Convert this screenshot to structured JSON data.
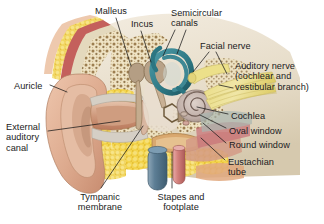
{
  "figure": {
    "background_color": "#ffffff",
    "width": 324,
    "height": 224,
    "label_color": "#1b1b22",
    "leader_color": "#1a1a1a"
  },
  "labels": [
    {
      "id": "malleus",
      "text": "Malleus",
      "x": 95,
      "y": 6,
      "align": "left"
    },
    {
      "id": "incus",
      "text": "Incus",
      "x": 131,
      "y": 19,
      "align": "left"
    },
    {
      "id": "semicircular_canals",
      "text": "Semicircular\ncanals",
      "x": 171,
      "y": 8,
      "align": "left"
    },
    {
      "id": "facial_nerve",
      "text": "Facial nerve",
      "x": 200,
      "y": 41,
      "align": "left"
    },
    {
      "id": "auditory_nerve",
      "text": "Auditory nerve\n(cochlear and\nvestibular branch)",
      "x": 235,
      "y": 61,
      "align": "left"
    },
    {
      "id": "auricle",
      "text": "Auricle",
      "x": 14,
      "y": 81,
      "align": "left"
    },
    {
      "id": "external_auditory_canal",
      "text": "External\nauditory\ncanal",
      "x": 6,
      "y": 122,
      "align": "left"
    },
    {
      "id": "cochlea",
      "text": "Cochlea",
      "x": 231,
      "y": 111,
      "align": "left"
    },
    {
      "id": "oval_window",
      "text": "Oval window",
      "x": 229,
      "y": 126,
      "align": "left"
    },
    {
      "id": "round_window",
      "text": "Round window",
      "x": 229,
      "y": 140,
      "align": "left"
    },
    {
      "id": "eustachian_tube",
      "text": "Eustachian\ntube",
      "x": 228,
      "y": 157,
      "align": "left"
    },
    {
      "id": "tympanic_membrane",
      "text": "Tympanic\nmembrane",
      "x": 68,
      "y": 192,
      "align": "left"
    },
    {
      "id": "stapes_and_footplate",
      "text": "Stapes and\nfootplate",
      "x": 153,
      "y": 192,
      "align": "left"
    }
  ],
  "leader_lines": [
    {
      "id": "leader-malleus",
      "points": "116,18 131,66"
    },
    {
      "id": "leader-incus",
      "points": "141,31 151,62"
    },
    {
      "id": "leader-semicircular",
      "points": "175,30 163,56"
    },
    {
      "id": "leader-semicircular-2",
      "points": "186,30 176,54"
    },
    {
      "id": "leader-facial-nerve",
      "points": "208,52 192,73"
    },
    {
      "id": "leader-facial-nerve-2",
      "points": "215,52 226,74"
    },
    {
      "id": "leader-auditory-nerve",
      "points": "232,88 219,85"
    },
    {
      "id": "leader-auricle",
      "points": "49,86 66,93"
    },
    {
      "id": "leader-external-canal",
      "points": "47,131 119,122"
    },
    {
      "id": "leader-cochlea",
      "points": "228,114 196,107"
    },
    {
      "id": "leader-oval-window",
      "points": "226,128 200,115"
    },
    {
      "id": "leader-round-window",
      "points": "226,143 202,122"
    },
    {
      "id": "leader-eustachian",
      "points": "225,160 201,137"
    },
    {
      "id": "leader-tympanic",
      "points": "100,189 142,126"
    },
    {
      "id": "leader-stapes",
      "points": "172,188 172,152"
    }
  ],
  "anatomy_colors": {
    "skin": "#e2b197",
    "skin_shadow": "#c1876c",
    "cartilage": "#d9d4cc",
    "bone_cortical": "#e6dcc4",
    "bone_spongy_bg": "#efe4c6",
    "bone_spongy_dot": "#8a6a3a",
    "marrow_fat": "#f2d24b",
    "marrow_fat_dark": "#d8ab1f",
    "muscle_red": "#c4605c",
    "nerve_yellow": "#ece08a",
    "canal_teal": "#2f7f8c",
    "vein_blue": "#5f7f96",
    "artery_pink": "#d98f8c",
    "cochlea_grey": "#b8a9a4",
    "eustachian_tan": "#d9a86f",
    "skull_cream": "#ece3d3"
  },
  "structures": [
    {
      "id": "auricle",
      "name": "Auricle (pinna)"
    },
    {
      "id": "external-auditory-canal",
      "name": "External auditory canal"
    },
    {
      "id": "tympanic-membrane",
      "name": "Tympanic membrane"
    },
    {
      "id": "malleus",
      "name": "Malleus"
    },
    {
      "id": "incus",
      "name": "Incus"
    },
    {
      "id": "stapes",
      "name": "Stapes and footplate"
    },
    {
      "id": "semicircular-canals",
      "name": "Semicircular canals"
    },
    {
      "id": "cochlea",
      "name": "Cochlea"
    },
    {
      "id": "oval-window",
      "name": "Oval window"
    },
    {
      "id": "round-window",
      "name": "Round window"
    },
    {
      "id": "eustachian-tube",
      "name": "Eustachian tube"
    },
    {
      "id": "facial-nerve",
      "name": "Facial nerve"
    },
    {
      "id": "auditory-nerve",
      "name": "Auditory nerve"
    },
    {
      "id": "jugular-vein",
      "name": "Jugular vein"
    },
    {
      "id": "carotid-artery",
      "name": "Carotid artery"
    },
    {
      "id": "mastoid-air-cells",
      "name": "Mastoid air cells"
    },
    {
      "id": "temporalis-muscle",
      "name": "Temporalis muscle"
    },
    {
      "id": "scalp",
      "name": "Scalp"
    }
  ]
}
